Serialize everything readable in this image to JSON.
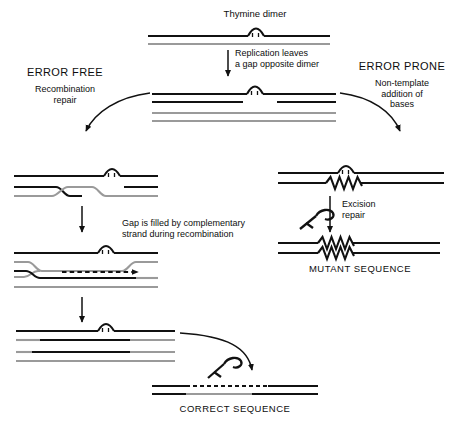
{
  "figure": {
    "title_top": "Thymine dimer",
    "labels": {
      "replication": "Replication leaves\na gap opposite dimer",
      "error_free_head": "ERROR FREE",
      "error_free_sub": "Recombination\nrepair",
      "error_prone_head": "ERROR PRONE",
      "error_prone_sub": "Non-template\naddition of\nbases",
      "gap_filled": "Gap is filled by complementary\nstrand during recombination",
      "excision": "Excision\nrepair",
      "mutant": "MUTANT SEQUENCE",
      "correct": "CORRECT SEQUENCE"
    },
    "icons": {
      "dimer": "thymine-dimer-arch-icon",
      "excised_dimer": "excised-dimer-hook-icon",
      "synthesis": "dashed-synthesis-arrow-icon",
      "mismatch": "zigzag-mismatch-icon"
    },
    "colors": {
      "dark_strand": "#111111",
      "light_strand": "#9a9a9a",
      "background": "#ffffff",
      "text": "#0d0d0d"
    },
    "panels": [
      {
        "id": "p1",
        "name": "intact-duplex-with-dimer",
        "strands": 2
      },
      {
        "id": "p2",
        "name": "replicated-duplexes-with-gap",
        "strands": 4
      },
      {
        "id": "p3",
        "name": "strand-exchange-crossover",
        "strands": 4
      },
      {
        "id": "p4",
        "name": "gap-filled-by-recombination",
        "strands": 4
      },
      {
        "id": "p5",
        "name": "resolved-duplexes",
        "strands": 4
      },
      {
        "id": "p6",
        "name": "nontemplate-bases-inserted",
        "strands": 2
      },
      {
        "id": "p7",
        "name": "mutant-duplex",
        "strands": 2
      },
      {
        "id": "p8",
        "name": "correct-duplex",
        "strands": 2
      }
    ]
  }
}
